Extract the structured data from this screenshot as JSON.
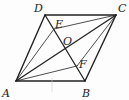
{
  "figure": {
    "type": "geometry",
    "shape": "parallelogram",
    "points": {
      "A": {
        "label": "A",
        "x": 16,
        "y": 81
      },
      "B": {
        "label": "B",
        "x": 85,
        "y": 81
      },
      "C": {
        "label": "C",
        "x": 116,
        "y": 15
      },
      "D": {
        "label": "D",
        "x": 45,
        "y": 15
      },
      "O": {
        "label": "O",
        "x": 66,
        "y": 48
      },
      "E": {
        "label": "E",
        "x": 54,
        "y": 29
      },
      "F": {
        "label": "F",
        "x": 77,
        "y": 66
      }
    },
    "segments": [
      "AB",
      "BC",
      "CD",
      "DA",
      "AC",
      "BD",
      "AE",
      "CE",
      "AF",
      "CF"
    ],
    "colors": {
      "line": "#222222",
      "label": "#222222",
      "background": "#fdfdfd"
    }
  }
}
